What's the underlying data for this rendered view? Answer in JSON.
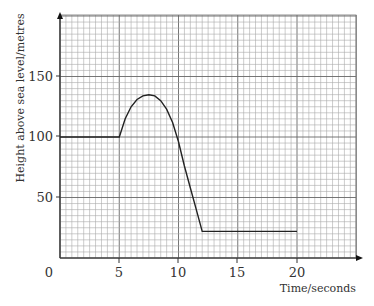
{
  "chart_data": {
    "type": "line",
    "title": "",
    "xlabel": "Time/seconds",
    "ylabel": "Height above sea level/metres",
    "xlim": [
      0,
      25
    ],
    "ylim": [
      0,
      200
    ],
    "x_ticks": [
      "0",
      "5",
      "10",
      "15",
      "20"
    ],
    "y_ticks": [
      "50",
      "100",
      "150"
    ],
    "grid": true,
    "grid_minor_x": 0.5,
    "grid_minor_y": 5,
    "series": [
      {
        "name": "height",
        "x": [
          0,
          5,
          5.5,
          6,
          6.5,
          7,
          7.5,
          8,
          8.5,
          9,
          9.5,
          10,
          10.5,
          11,
          11.5,
          12,
          20
        ],
        "y": [
          100,
          100,
          115,
          125,
          131,
          134,
          135,
          134,
          130,
          123,
          112,
          96,
          76,
          58,
          40,
          22,
          22
        ]
      }
    ]
  },
  "labels": {
    "origin": "0",
    "x5": "5",
    "x10": "10",
    "x15": "15",
    "x20": "20",
    "y50": "50",
    "y100": "100",
    "y150": "150",
    "xlabel": "Time/seconds",
    "ylabel": "Height above sea level/metres"
  }
}
